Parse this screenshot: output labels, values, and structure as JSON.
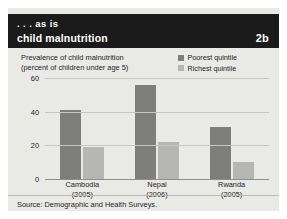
{
  "header": {
    "kicker": ". . . as is",
    "title": "child malnutrition",
    "badge": "2b"
  },
  "chart_data": {
    "type": "bar",
    "title": "Prevalence of child malnutrition",
    "subtitle": "(percent of children under age 5)",
    "xlabel": "",
    "ylabel": "",
    "ylim": [
      0,
      60
    ],
    "yticks": [
      0,
      20,
      40,
      60
    ],
    "ytick_labels": [
      "0",
      "20",
      "40",
      "60"
    ],
    "grid": true,
    "legend_position": "top-right",
    "categories": [
      "Cambodia",
      "Nepal",
      "Rwanda"
    ],
    "category_years": [
      "(2005)",
      "(2006)",
      "(2005)"
    ],
    "series": [
      {
        "name": "Poorest quintile",
        "color": "#7e7e7c",
        "values": [
          41,
          56,
          31
        ]
      },
      {
        "name": "Richest quintile",
        "color": "#b6b6b2",
        "values": [
          19,
          22,
          10
        ]
      }
    ]
  },
  "source": {
    "text": "Source: Demographic and Health Surveys."
  }
}
